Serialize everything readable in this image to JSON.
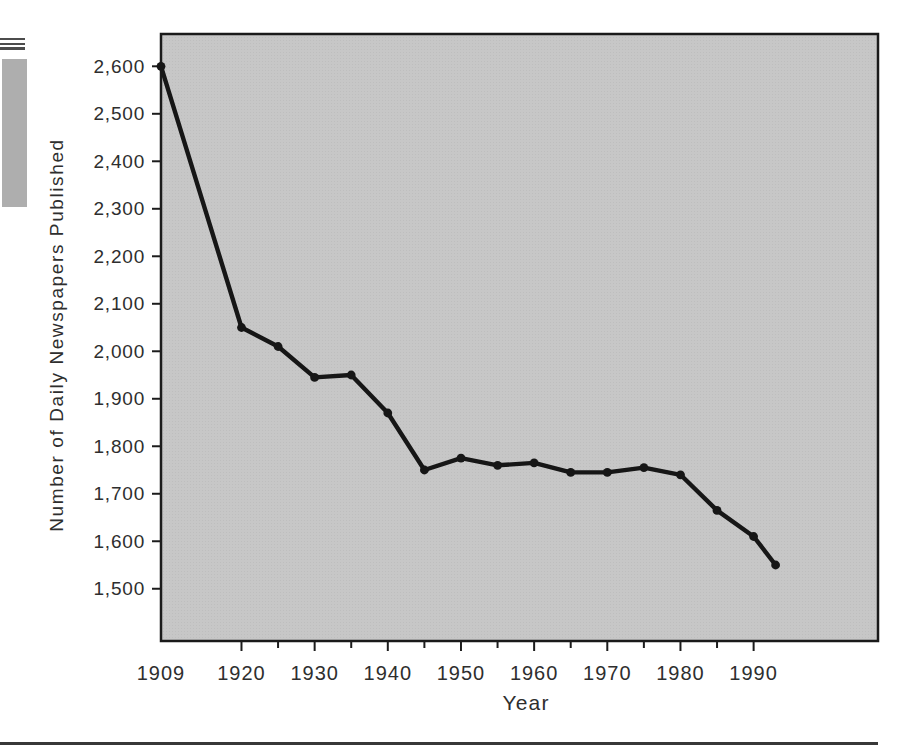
{
  "page": {
    "background_color": "#ffffff",
    "decorations": {
      "edge_lines_icon": "triple-scan-lines-icon",
      "edge_bar_icon": "gray-edge-bar",
      "edge_bar_color": "#aeaeae",
      "bottom_rule_color": "#383838"
    }
  },
  "chart_data": {
    "type": "line",
    "title": "",
    "xlabel": "Year",
    "ylabel": "Number of Daily Newspapers Published",
    "series": [
      {
        "name": "Daily newspapers published",
        "x": [
          1909,
          1920,
          1925,
          1930,
          1935,
          1940,
          1945,
          1950,
          1955,
          1960,
          1965,
          1970,
          1975,
          1980,
          1985,
          1990,
          1993
        ],
        "y": [
          2600,
          2050,
          2010,
          1945,
          1950,
          1870,
          1750,
          1775,
          1760,
          1765,
          1745,
          1745,
          1755,
          1740,
          1665,
          1610,
          1550
        ]
      }
    ],
    "xlim": [
      1909,
      2007
    ],
    "ylim": [
      1390,
      2668
    ],
    "x_ticks": [
      1920,
      1925,
      1930,
      1935,
      1940,
      1945,
      1950,
      1955,
      1960,
      1965,
      1970,
      1975,
      1980,
      1985,
      1990
    ],
    "x_major_ticks": [
      1920,
      1930,
      1940,
      1950,
      1960,
      1970,
      1980,
      1990
    ],
    "x_label_positions": [
      1909,
      1920,
      1930,
      1940,
      1950,
      1960,
      1970,
      1980,
      1990
    ],
    "x_label_texts": [
      "1909",
      "1920",
      "1930",
      "1940",
      "1950",
      "1960",
      "1970",
      "1980",
      "1990"
    ],
    "y_ticks": [
      1500,
      1600,
      1700,
      1800,
      1900,
      2000,
      2100,
      2200,
      2300,
      2400,
      2500,
      2600
    ],
    "y_tick_labels": [
      "1,500",
      "1,600",
      "1,700",
      "1,800",
      "1,900",
      "2,000",
      "2,100",
      "2,200",
      "2,300",
      "2,400",
      "2,500",
      "2,600"
    ],
    "grid": false,
    "legend": false,
    "styles": {
      "plot_bg": "#c7c7c7",
      "plot_bg_dot": "#bdbdbd",
      "border_color": "#1a1a1a",
      "line_color": "#161616",
      "marker_color": "#161616",
      "tick_color": "#1c1c1c",
      "text_color": "#2e2e2e"
    }
  }
}
